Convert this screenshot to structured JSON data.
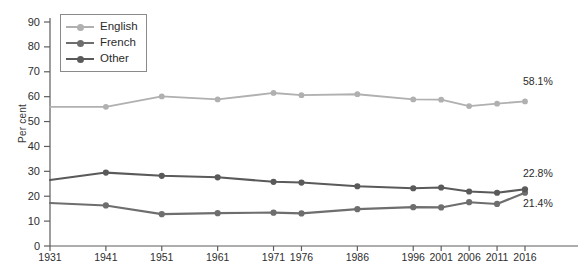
{
  "chart_data": {
    "type": "line",
    "title": "",
    "xlabel": "",
    "ylabel": "Per cent",
    "ylim": [
      0,
      90
    ],
    "ytick_step": 10,
    "yticks": [
      "0",
      "10",
      "20",
      "30",
      "40",
      "50",
      "60",
      "70",
      "80",
      "90"
    ],
    "grid": false,
    "legend_position": "top-left-inside",
    "x": [
      1931,
      1941,
      1951,
      1961,
      1971,
      1976,
      1986,
      1996,
      2001,
      2006,
      2011,
      2016
    ],
    "categories": [
      "1931",
      "1941",
      "1951",
      "1961",
      "1971",
      "1976",
      "1986",
      "1996",
      "2001",
      "2006",
      "2011",
      "2016"
    ],
    "series": [
      {
        "name": "English",
        "color": "#b0b0b0",
        "values": [
          55.9,
          55.9,
          60.1,
          58.9,
          61.5,
          60.6,
          61.0,
          58.9,
          58.8,
          56.2,
          57.2,
          58.1
        ],
        "end_label": "58.1%"
      },
      {
        "name": "French",
        "color": "#6e6e6e",
        "values": [
          17.3,
          16.3,
          12.8,
          13.2,
          13.4,
          13.1,
          14.8,
          15.6,
          15.5,
          17.6,
          16.9,
          21.4
        ],
        "end_label": "21.4%"
      },
      {
        "name": "Other",
        "color": "#5a5a5a",
        "values": [
          26.5,
          29.5,
          28.2,
          27.6,
          25.8,
          25.5,
          24.0,
          23.2,
          23.5,
          21.9,
          21.4,
          22.8
        ],
        "end_label": "22.8%"
      }
    ]
  },
  "legend": {
    "items": [
      {
        "label": "English"
      },
      {
        "label": "French"
      },
      {
        "label": "Other"
      }
    ]
  },
  "end_labels": {
    "english": "58.1%",
    "other": "22.8%",
    "french": "21.4%"
  }
}
